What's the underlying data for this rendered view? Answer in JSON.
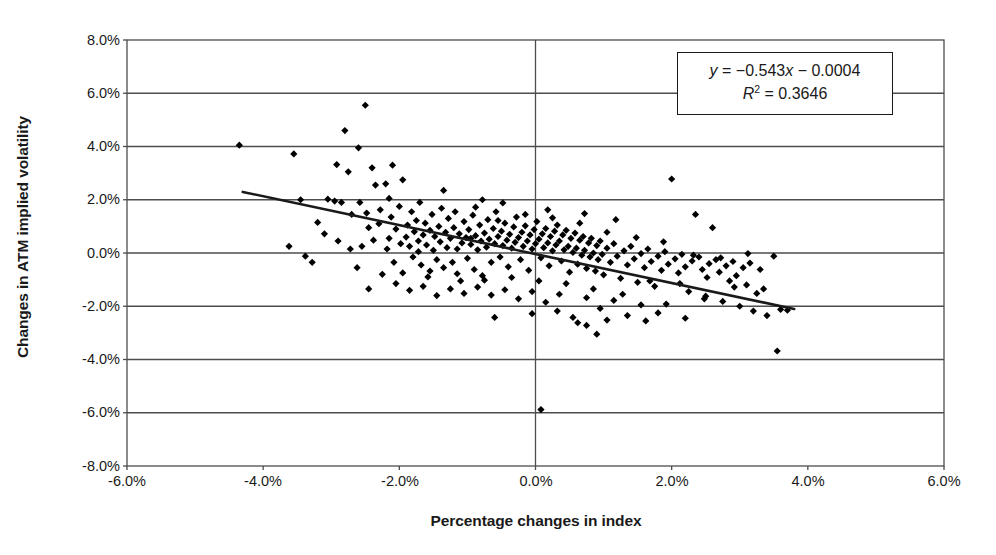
{
  "chart_data": {
    "type": "scatter",
    "title": "",
    "xlabel": "Percentage changes in index",
    "ylabel": "Changes in ATM implied volatility",
    "xlim": [
      -6.0,
      6.0
    ],
    "ylim": [
      -8.0,
      8.0
    ],
    "xticks": [
      "-6.0%",
      "-4.0%",
      "-2.0%",
      "0.0%",
      "2.0%",
      "4.0%",
      "6.0%"
    ],
    "xtick_values": [
      -6.0,
      -4.0,
      -2.0,
      0.0,
      2.0,
      4.0,
      6.0
    ],
    "yticks": [
      "8.0%",
      "6.0%",
      "4.0%",
      "2.0%",
      "0.0%",
      "-2.0%",
      "-4.0%",
      "-6.0%",
      "-8.0%"
    ],
    "ytick_values": [
      8.0,
      6.0,
      4.0,
      2.0,
      0.0,
      -2.0,
      -4.0,
      -6.0,
      -8.0
    ],
    "grid": "horizontal",
    "legend": "none",
    "marker": "diamond",
    "marker_color": "#000000",
    "trendline": {
      "equation": "y = -0.543x - 0.0004",
      "slope": -0.543,
      "intercept": -0.0004,
      "r_squared": 0.3646,
      "x_start": -4.3,
      "x_end": 3.8,
      "color": "#1a1a1a"
    },
    "annotation": {
      "equation_text": "y = −0.543x − 0.0004",
      "r2_text": "R² = 0.3646",
      "eq_y": "y",
      "eq_rest": " = −0.543",
      "eq_x": "x",
      "eq_tail": " − 0.0004",
      "r2_r": "R",
      "r2_exp": "2",
      "r2_val": " = 0.3646"
    },
    "points": [
      [
        -4.35,
        4.05
      ],
      [
        -3.55,
        3.72
      ],
      [
        -3.45,
        2.0
      ],
      [
        -3.2,
        1.15
      ],
      [
        -3.1,
        0.72
      ],
      [
        -3.05,
        2.02
      ],
      [
        -2.95,
        1.95
      ],
      [
        -2.92,
        3.32
      ],
      [
        -2.85,
        1.9
      ],
      [
        -2.8,
        4.6
      ],
      [
        -2.75,
        3.05
      ],
      [
        -2.7,
        1.45
      ],
      [
        -2.6,
        3.95
      ],
      [
        -2.58,
        1.9
      ],
      [
        -2.5,
        5.55
      ],
      [
        -2.48,
        1.5
      ],
      [
        -2.45,
        0.95
      ],
      [
        -2.4,
        3.2
      ],
      [
        -2.35,
        2.55
      ],
      [
        -2.3,
        1.1
      ],
      [
        -2.28,
        1.62
      ],
      [
        -2.2,
        2.6
      ],
      [
        -2.15,
        0.55
      ],
      [
        -2.12,
        1.35
      ],
      [
        -2.1,
        3.3
      ],
      [
        -2.05,
        0.9
      ],
      [
        -2.0,
        1.75
      ],
      [
        -1.98,
        0.35
      ],
      [
        -1.95,
        2.75
      ],
      [
        -1.9,
        0.6
      ],
      [
        -1.88,
        1.05
      ],
      [
        -1.85,
        0.25
      ],
      [
        -1.82,
        1.55
      ],
      [
        -1.8,
        -0.15
      ],
      [
        -1.78,
        0.8
      ],
      [
        -1.75,
        1.22
      ],
      [
        -1.72,
        0.45
      ],
      [
        -1.7,
        1.9
      ],
      [
        -1.68,
        -0.45
      ],
      [
        -1.65,
        0.68
      ],
      [
        -1.62,
        1.12
      ],
      [
        -1.6,
        0.3
      ],
      [
        -1.58,
        -0.9
      ],
      [
        -1.55,
        0.85
      ],
      [
        -1.52,
        1.45
      ],
      [
        -1.5,
        0.1
      ],
      [
        -1.48,
        0.62
      ],
      [
        -1.45,
        -0.25
      ],
      [
        -1.42,
        1.0
      ],
      [
        -1.4,
        0.42
      ],
      [
        -1.38,
        1.68
      ],
      [
        -1.35,
        -0.55
      ],
      [
        -1.32,
        0.78
      ],
      [
        -1.3,
        0.2
      ],
      [
        -1.28,
        1.3
      ],
      [
        -1.25,
        0.55
      ],
      [
        -1.22,
        -0.35
      ],
      [
        -1.2,
        0.95
      ],
      [
        -1.18,
        1.55
      ],
      [
        -1.15,
        0.15
      ],
      [
        -1.12,
        0.72
      ],
      [
        -1.1,
        -1.05
      ],
      [
        -1.08,
        0.38
      ],
      [
        -1.05,
        1.18
      ],
      [
        -1.02,
        0.58
      ],
      [
        -1.0,
        -0.2
      ],
      [
        -0.98,
        0.88
      ],
      [
        -0.95,
        0.32
      ],
      [
        -0.92,
        1.42
      ],
      [
        -0.9,
        -0.62
      ],
      [
        -0.88,
        0.65
      ],
      [
        -0.85,
        0.12
      ],
      [
        -0.82,
        1.05
      ],
      [
        -0.8,
        0.45
      ],
      [
        -0.78,
        2.0
      ],
      [
        -0.78,
        -0.85
      ],
      [
        -0.75,
        0.75
      ],
      [
        -0.72,
        0.22
      ],
      [
        -0.7,
        1.25
      ],
      [
        -0.68,
        0.52
      ],
      [
        -0.65,
        -0.35
      ],
      [
        -0.62,
        0.92
      ],
      [
        -0.6,
        0.35
      ],
      [
        -0.58,
        1.55
      ],
      [
        -0.55,
        0.62
      ],
      [
        -0.52,
        -0.15
      ],
      [
        -0.5,
        0.82
      ],
      [
        -0.48,
        0.28
      ],
      [
        -0.45,
        1.12
      ],
      [
        -0.42,
        0.48
      ],
      [
        -0.4,
        -0.52
      ],
      [
        -0.38,
        0.7
      ],
      [
        -0.35,
        0.18
      ],
      [
        -0.32,
        0.98
      ],
      [
        -0.3,
        0.4
      ],
      [
        -0.28,
        1.35
      ],
      [
        -0.25,
        0.58
      ],
      [
        -0.22,
        -0.25
      ],
      [
        -0.2,
        0.78
      ],
      [
        -0.18,
        0.25
      ],
      [
        -0.15,
        1.02
      ],
      [
        -0.12,
        0.45
      ],
      [
        -0.1,
        -0.65
      ],
      [
        -0.08,
        0.68
      ],
      [
        -0.05,
        0.15
      ],
      [
        -0.02,
        0.88
      ],
      [
        0.0,
        0.35
      ],
      [
        0.02,
        1.18
      ],
      [
        0.05,
        0.52
      ],
      [
        0.08,
        -0.18
      ],
      [
        0.1,
        0.72
      ],
      [
        0.12,
        0.2
      ],
      [
        0.15,
        0.92
      ],
      [
        0.18,
        0.38
      ],
      [
        0.2,
        -0.48
      ],
      [
        0.22,
        0.62
      ],
      [
        0.25,
        0.08
      ],
      [
        0.28,
        0.82
      ],
      [
        0.3,
        0.3
      ],
      [
        0.32,
        1.05
      ],
      [
        0.35,
        0.45
      ],
      [
        0.38,
        -0.3
      ],
      [
        0.4,
        0.68
      ],
      [
        0.42,
        0.12
      ],
      [
        0.45,
        0.85
      ],
      [
        0.48,
        0.25
      ],
      [
        0.5,
        -0.72
      ],
      [
        0.52,
        0.55
      ],
      [
        0.55,
        0.02
      ],
      [
        0.58,
        0.75
      ],
      [
        0.6,
        0.18
      ],
      [
        0.62,
        -0.42
      ],
      [
        0.65,
        0.48
      ],
      [
        0.68,
        -0.08
      ],
      [
        0.7,
        0.62
      ],
      [
        0.72,
        0.1
      ],
      [
        0.75,
        -0.58
      ],
      [
        0.78,
        0.38
      ],
      [
        0.8,
        -0.15
      ],
      [
        0.82,
        0.55
      ],
      [
        0.85,
        0.0
      ],
      [
        0.88,
        -0.68
      ],
      [
        0.9,
        0.28
      ],
      [
        0.92,
        -0.25
      ],
      [
        0.95,
        0.45
      ],
      [
        0.98,
        -0.05
      ],
      [
        1.0,
        -0.82
      ],
      [
        1.05,
        0.18
      ],
      [
        1.1,
        -0.35
      ],
      [
        1.15,
        0.35
      ],
      [
        1.2,
        -0.12
      ],
      [
        1.25,
        -0.95
      ],
      [
        1.3,
        0.08
      ],
      [
        1.35,
        -0.45
      ],
      [
        1.4,
        0.25
      ],
      [
        1.45,
        -0.22
      ],
      [
        1.5,
        -1.1
      ],
      [
        1.55,
        -0.02
      ],
      [
        1.6,
        -0.55
      ],
      [
        1.65,
        0.15
      ],
      [
        1.7,
        -0.32
      ],
      [
        1.75,
        -1.25
      ],
      [
        1.8,
        -0.12
      ],
      [
        1.85,
        -0.65
      ],
      [
        1.9,
        0.05
      ],
      [
        1.95,
        -0.42
      ],
      [
        2.0,
        2.78
      ],
      [
        2.05,
        -0.22
      ],
      [
        2.1,
        -0.75
      ],
      [
        2.15,
        -0.05
      ],
      [
        2.2,
        -0.52
      ],
      [
        2.25,
        -1.45
      ],
      [
        2.3,
        -0.3
      ],
      [
        2.35,
        1.45
      ],
      [
        2.4,
        -0.15
      ],
      [
        2.45,
        -0.62
      ],
      [
        2.5,
        -1.62
      ],
      [
        2.55,
        -0.4
      ],
      [
        2.6,
        0.95
      ],
      [
        2.65,
        -0.25
      ],
      [
        2.7,
        -0.72
      ],
      [
        2.75,
        -1.82
      ],
      [
        2.8,
        -0.48
      ],
      [
        2.85,
        -1.05
      ],
      [
        2.9,
        -0.32
      ],
      [
        2.95,
        -0.85
      ],
      [
        3.0,
        -2.0
      ],
      [
        3.05,
        -0.55
      ],
      [
        3.1,
        -1.2
      ],
      [
        3.15,
        -0.38
      ],
      [
        3.2,
        -2.18
      ],
      [
        3.3,
        -0.62
      ],
      [
        3.4,
        -2.35
      ],
      [
        3.5,
        -0.12
      ],
      [
        3.55,
        -3.68
      ],
      [
        3.6,
        -2.12
      ],
      [
        3.7,
        -2.15
      ],
      [
        -2.62,
        -0.55
      ],
      [
        -2.45,
        -1.35
      ],
      [
        -2.25,
        -0.8
      ],
      [
        -2.05,
        -1.15
      ],
      [
        -1.85,
        -1.4
      ],
      [
        -1.65,
        -1.25
      ],
      [
        -1.45,
        -1.6
      ],
      [
        -1.25,
        -1.35
      ],
      [
        -1.05,
        -1.52
      ],
      [
        -0.85,
        -1.28
      ],
      [
        -0.65,
        -1.58
      ],
      [
        -0.45,
        -1.38
      ],
      [
        -0.25,
        -1.72
      ],
      [
        -0.05,
        -1.45
      ],
      [
        0.15,
        -1.85
      ],
      [
        0.35,
        -1.55
      ],
      [
        0.55,
        -2.42
      ],
      [
        0.75,
        -1.68
      ],
      [
        0.95,
        -2.08
      ],
      [
        1.15,
        -1.78
      ],
      [
        1.35,
        -2.35
      ],
      [
        1.55,
        -1.95
      ],
      [
        -0.6,
        -2.42
      ],
      [
        0.08,
        -5.88
      ],
      [
        0.62,
        -2.62
      ],
      [
        0.75,
        -2.72
      ],
      [
        0.9,
        -3.05
      ],
      [
        1.05,
        -2.52
      ],
      [
        1.8,
        -2.25
      ],
      [
        2.2,
        -2.45
      ],
      [
        1.62,
        -2.55
      ],
      [
        -3.28,
        -0.35
      ],
      [
        -2.9,
        0.45
      ],
      [
        -2.72,
        0.15
      ],
      [
        -2.55,
        0.25
      ],
      [
        -2.38,
        0.48
      ],
      [
        -2.18,
        0.15
      ],
      [
        -1.95,
        -0.75
      ],
      [
        -1.55,
        -0.68
      ],
      [
        -1.15,
        -0.78
      ],
      [
        -0.95,
        0.55
      ],
      [
        -0.75,
        -1.02
      ],
      [
        -0.55,
        1.22
      ],
      [
        -0.35,
        -0.92
      ],
      [
        -0.15,
        1.45
      ],
      [
        0.05,
        -1.05
      ],
      [
        0.25,
        1.32
      ],
      [
        0.45,
        -1.15
      ],
      [
        0.65,
        1.12
      ],
      [
        0.85,
        -1.35
      ],
      [
        1.05,
        0.78
      ],
      [
        1.28,
        -1.55
      ],
      [
        1.48,
        0.58
      ],
      [
        1.68,
        -1.05
      ],
      [
        1.88,
        0.42
      ],
      [
        2.12,
        -1.15
      ],
      [
        2.32,
        -0.08
      ],
      [
        2.52,
        -0.92
      ],
      [
        2.72,
        -0.18
      ],
      [
        2.92,
        -1.28
      ],
      [
        3.12,
        -0.02
      ],
      [
        3.35,
        -1.35
      ],
      [
        -2.15,
        2.05
      ],
      [
        -1.35,
        2.35
      ],
      [
        -0.88,
        1.72
      ],
      [
        -0.48,
        1.88
      ],
      [
        0.18,
        1.62
      ],
      [
        0.72,
        1.48
      ],
      [
        1.18,
        1.25
      ],
      [
        -3.62,
        0.25
      ],
      [
        -3.38,
        -0.12
      ],
      [
        -2.08,
        -0.35
      ],
      [
        -1.72,
        0.05
      ],
      [
        -0.05,
        -2.28
      ],
      [
        0.32,
        -2.18
      ],
      [
        1.92,
        -1.92
      ],
      [
        2.48,
        -1.72
      ],
      [
        3.25,
        -1.52
      ]
    ],
    "point_count": 260
  }
}
